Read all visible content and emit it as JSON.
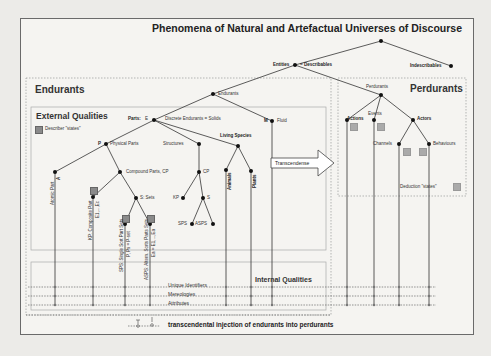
{
  "title": "Phenomena of Natural and Artefactual Universes of Discourse",
  "nodes": {
    "entities": "Entities",
    "describables": "= Describables",
    "indescribables": "Indescribables",
    "endurants": "Endurants",
    "perdurants": "Perdurants",
    "parts": "Parts:",
    "parts_e": "E",
    "discrete": "Discrete Endurants = Solids",
    "fluid_m": "M",
    "fluid": "Fluid",
    "physical_p": "P",
    "physical_parts": "Physical Parts",
    "structures": "Structures",
    "living_species": "Living Species",
    "atomic_part": "Atomic Part",
    "atomic_a": "A",
    "compound_parts": "Compound Parts, CP",
    "cp": "CP",
    "composite_part": "KP: Composite Part",
    "composite_expr": "E1,...,Ec",
    "sets": "S: Sets",
    "kp": "KP",
    "s": "S",
    "sps": "SPS",
    "asps": "ASPS",
    "single_sort": "SPS: Single Sort Part Sets",
    "single_expr": "P, Ps = P-set",
    "alt_sort": "ASPS: Altern. Sorts Parts Sets",
    "alt_expr": "Ea = E1,...,Ea",
    "animals": "Animals",
    "plants": "Plants",
    "actions": "Actions",
    "events": "Events",
    "actors": "Actors",
    "channels": "Channels",
    "behaviours": "Behaviours"
  },
  "panels": {
    "endurants": "Endurants",
    "external_qualities": "External Qualities",
    "describer_states": "Describer \"states\"",
    "perdurants": "Perdurants",
    "deduction_states": "Deduction \"states\"",
    "internal_qualities": "Internal Qualities"
  },
  "internal": {
    "unique_identifiers": "Unique Identifiers",
    "mereologies": "Mereologies",
    "attributes": "Attributes"
  },
  "transcendence": "Transcendense",
  "footer": "transcendental injection of endurants into perdurants",
  "colors": {
    "background": "#f5f4f1",
    "line": "#333333",
    "node": "#111111",
    "state_marker": "#8a8a8a"
  }
}
